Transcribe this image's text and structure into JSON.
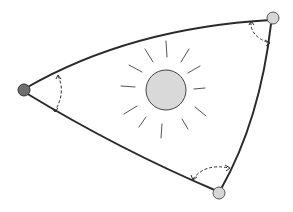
{
  "diagram": {
    "type": "spherical-triangle-with-sun",
    "colors": {
      "background": "#ffffff",
      "edge": "#2a2a2a",
      "sun_fill": "#d9d9d9",
      "sun_rays": "#555555",
      "vertex_left": "#6e6e6e",
      "vertex_other": "#d6d6d6"
    },
    "vertices": [
      {
        "id": "left",
        "x": 24,
        "y": 90
      },
      {
        "id": "top-right",
        "x": 273,
        "y": 18
      },
      {
        "id": "bottom",
        "x": 219,
        "y": 193
      }
    ],
    "sun": {
      "cx": 166,
      "cy": 90,
      "r": 20,
      "ray_count": 12
    },
    "angle_markers": 3
  }
}
